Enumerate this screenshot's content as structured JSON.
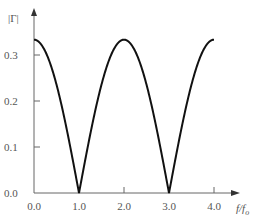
{
  "chart_data": {
    "type": "line",
    "title": "",
    "xlabel": "f/fo",
    "ylabel": "|Γ|",
    "xlim": [
      0.0,
      4.0
    ],
    "ylim": [
      0.0,
      0.333
    ],
    "grid": false,
    "legend": null,
    "x_ticks": [
      "0.0",
      "1.0",
      "2.0",
      "3.0",
      "4.0"
    ],
    "y_ticks": [
      "0.0",
      "0.1",
      "0.2",
      "0.3"
    ],
    "series": [
      {
        "name": "|Γ|",
        "function": "(1/3)*|cos(pi*f/(2*fo))|",
        "x": [
          0.0,
          0.5,
          1.0,
          1.5,
          2.0,
          2.5,
          3.0,
          3.5,
          4.0
        ],
        "values": [
          0.333,
          0.236,
          0.0,
          0.236,
          0.333,
          0.236,
          0.0,
          0.236,
          0.333
        ]
      }
    ]
  }
}
